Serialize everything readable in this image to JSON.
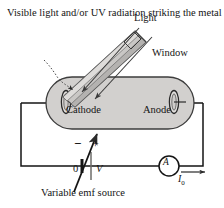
{
  "figure": {
    "background_color": "#ffffff",
    "ink_color": "#141414",
    "fill_gray": "#d2d0ce",
    "shade_gray": "#b9b7b5"
  },
  "caption": {
    "text": "Visible light and/or UV radiation striking the metal plate causes a current to flow."
  },
  "labels": {
    "light": "Light",
    "window": "Window",
    "cathode": "Cathode",
    "anode": "Anode",
    "minus": "−",
    "plus": "+",
    "zero": "0",
    "voltage": "V",
    "emf_source": "Variable emf source",
    "ammeter": "A",
    "current": "I"
  },
  "current_subscript": "0",
  "components": [
    {
      "name": "phototube",
      "type": "evacuated-tube",
      "shape": "rounded-capsule"
    },
    {
      "name": "cathode-electrode",
      "type": "electrode",
      "shape": "ellipse"
    },
    {
      "name": "anode-electrode",
      "type": "electrode",
      "shape": "ellipse"
    },
    {
      "name": "light-beam",
      "type": "beam-tube",
      "angle_degrees": 45
    },
    {
      "name": "window",
      "type": "aperture"
    },
    {
      "name": "battery",
      "type": "variable-emf-source"
    },
    {
      "name": "ammeter",
      "type": "meter"
    }
  ],
  "rays": [
    {
      "name": "light-ray-1",
      "target": "cathode"
    },
    {
      "name": "light-ray-2",
      "target": "cathode"
    }
  ],
  "circuit": {
    "wire_color": "#141414",
    "current_direction": "rightward"
  }
}
